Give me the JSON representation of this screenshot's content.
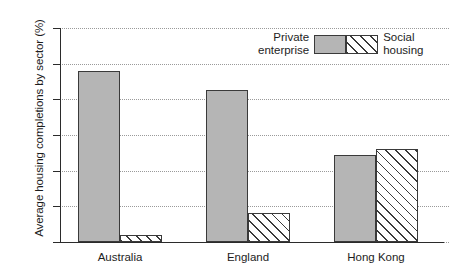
{
  "chart_data": {
    "type": "bar",
    "title": "",
    "xlabel": "",
    "ylabel": "Average housing completions by sector (%)",
    "categories": [
      "Australia",
      "England",
      "Hong Kong"
    ],
    "series": [
      {
        "name": "Private enterprise",
        "values": [
          96,
          85,
          49
        ],
        "fill": "#b5b5b5",
        "pattern": "solid"
      },
      {
        "name": "Social housing",
        "values": [
          4,
          16,
          52
        ],
        "fill": "#ffffff",
        "pattern": "diagonal-hatch"
      }
    ],
    "ylim": [
      0,
      120
    ],
    "yticks": [
      0,
      20,
      40,
      60,
      80,
      100,
      120
    ],
    "ytick_labels": [
      "0",
      "20",
      "40",
      "60",
      "80",
      "100",
      "120"
    ],
    "grid": "horizontal-dotted",
    "legend_position": "top-right"
  },
  "legend": {
    "left_label": "Private\nenterprise",
    "right_label": "Social\nhousing"
  },
  "colors": {
    "bar_fill": "#b5b5b5",
    "bar_edge": "#3a3a3a",
    "axis": "#2b2b2b",
    "grid": "#9a9a9a",
    "background": "#ffffff"
  }
}
